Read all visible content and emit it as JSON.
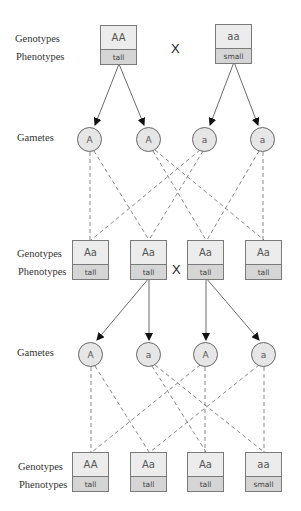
{
  "labels": {
    "genotypes": "Genotypes",
    "phenotypes": "Phenotypes",
    "gametes": "Gametes",
    "cross_symbol": "X"
  },
  "parents": [
    {
      "genotype": "AA",
      "phenotype": "tall"
    },
    {
      "genotype": "aa",
      "phenotype": "small"
    }
  ],
  "gametes_1": [
    "A",
    "A",
    "a",
    "a"
  ],
  "f1": [
    {
      "genotype": "Aa",
      "phenotype": "tall"
    },
    {
      "genotype": "Aa",
      "phenotype": "tall"
    },
    {
      "genotype": "Aa",
      "phenotype": "tall"
    },
    {
      "genotype": "Aa",
      "phenotype": "tall"
    }
  ],
  "gametes_2": [
    "A",
    "a",
    "A",
    "a"
  ],
  "f2": [
    {
      "genotype": "AA",
      "phenotype": "tall"
    },
    {
      "genotype": "Aa",
      "phenotype": "tall"
    },
    {
      "genotype": "Aa",
      "phenotype": "tall"
    },
    {
      "genotype": "aa",
      "phenotype": "small"
    }
  ],
  "colors": {
    "genotype_fill": "#ececec",
    "phenotype_fill": "#d5d5d5",
    "gamete_fill": "#e6e6e6",
    "border": "#7a7a7a"
  }
}
